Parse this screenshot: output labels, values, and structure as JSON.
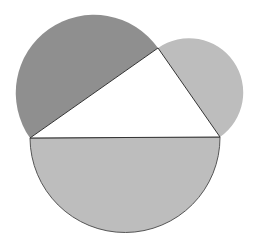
{
  "diagram": {
    "triangle": {
      "vertices": {
        "A": [
          30,
          138
        ],
        "B": [
          158,
          48
        ],
        "C": [
          220,
          137
        ]
      },
      "fill": "#ffffff",
      "stroke": "#333333"
    },
    "semicircles": [
      {
        "side": "AB",
        "radius": 78,
        "fill": "#8f8f8f"
      },
      {
        "side": "BC",
        "radius": 54,
        "fill": "#bdbdbd"
      },
      {
        "side": "AC",
        "radius": 95,
        "fill": "#bdbdbd"
      }
    ]
  }
}
